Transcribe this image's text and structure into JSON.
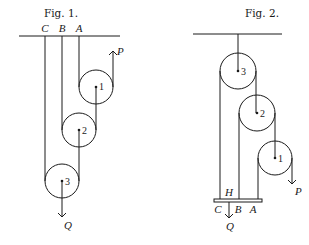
{
  "figures": [
    {
      "title": "Fig. 1.",
      "support_labels": [
        "C",
        "B",
        "A"
      ],
      "pulleys": [
        "1",
        "2",
        "3"
      ],
      "effort_label": "P",
      "load_label": "Q"
    },
    {
      "title": "Fig. 2.",
      "bar_label": "H",
      "support_labels": [
        "C",
        "B",
        "A"
      ],
      "pulleys": [
        "3",
        "2",
        "1"
      ],
      "effort_label": "P",
      "load_label": "Q"
    }
  ],
  "colors": {
    "ink": "#1a1a1a",
    "background": "#ffffff"
  }
}
